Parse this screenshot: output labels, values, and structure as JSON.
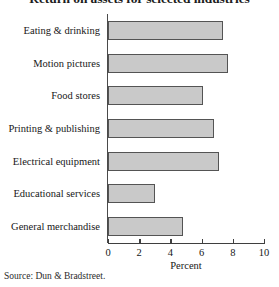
{
  "chart_data": {
    "type": "bar",
    "orientation": "horizontal",
    "title": "Return on assets for selected industries",
    "xlabel": "Percent",
    "ylabel": "",
    "xlim": [
      0,
      10
    ],
    "xticks": [
      0,
      2,
      4,
      6,
      8,
      10
    ],
    "xtick_labels": [
      "0",
      "2",
      "4",
      "6",
      "8",
      "10"
    ],
    "grid": false,
    "legend": null,
    "categories": [
      "Eating & drinking",
      "Motion pictures",
      "Food stores",
      "Printing & publishing",
      "Electrical equipment",
      "Educational services",
      "General merchandise"
    ],
    "values": [
      7.4,
      7.7,
      6.1,
      6.8,
      7.1,
      3.0,
      4.8
    ],
    "bar_fill_color": "#c9c9c9",
    "bar_edge_color": "#545454",
    "source": "Source: Dun & Bradstreet."
  },
  "title": "Return on assets for selected industries",
  "axis": {
    "x_title": "Percent",
    "tick_labels": [
      "0",
      "2",
      "4",
      "6",
      "8",
      "10"
    ]
  },
  "categories": [
    {
      "label": "Eating & drinking"
    },
    {
      "label": "Motion pictures"
    },
    {
      "label": "Food stores"
    },
    {
      "label": "Printing & publishing"
    },
    {
      "label": "Electrical equipment"
    },
    {
      "label": "Educational services"
    },
    {
      "label": "General merchandise"
    }
  ],
  "source": "Source: Dun & Bradstreet."
}
